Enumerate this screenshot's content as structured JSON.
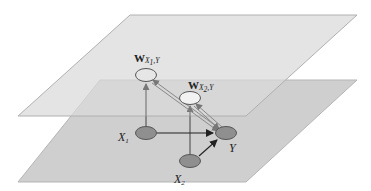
{
  "diagram": {
    "colors": {
      "background": "#ffffff",
      "bottom_plane": "#cfcfcf",
      "top_plane": "#dedede",
      "plane_edge": "#b0b0b0",
      "node_fill": "#8f8f8f",
      "weight_node_fill": "#e8e8e8",
      "node_stroke": "#555555",
      "arrow_dark": "#222222",
      "arrow_light": "#777777"
    },
    "planes": [
      {
        "id": "top-plane",
        "label": ""
      },
      {
        "id": "bottom-plane",
        "label": ""
      }
    ],
    "nodes": [
      {
        "id": "wx1y",
        "label_main": "W",
        "label_sub": "X",
        "label_sub_idx": "1",
        "label_tail": ",Y",
        "layer": "top"
      },
      {
        "id": "wx2y",
        "label_main": "W",
        "label_sub": "X",
        "label_sub_idx": "2",
        "label_tail": ",Y",
        "layer": "top"
      },
      {
        "id": "x1",
        "label_main": "X",
        "label_sub_idx": "1",
        "layer": "bottom"
      },
      {
        "id": "x2",
        "label_main": "X",
        "label_sub_idx": "2",
        "layer": "bottom"
      },
      {
        "id": "y",
        "label_main": "Y",
        "layer": "bottom"
      }
    ],
    "edges": [
      {
        "from": "x1",
        "to": "y",
        "style": "dark"
      },
      {
        "from": "x2",
        "to": "y",
        "style": "dark"
      },
      {
        "from": "x1",
        "to": "wx1y",
        "style": "light"
      },
      {
        "from": "x2",
        "to": "wx2y",
        "style": "light"
      },
      {
        "from": "y",
        "to": "wx1y",
        "style": "light-double"
      },
      {
        "from": "y",
        "to": "wx2y",
        "style": "light-double"
      }
    ]
  }
}
